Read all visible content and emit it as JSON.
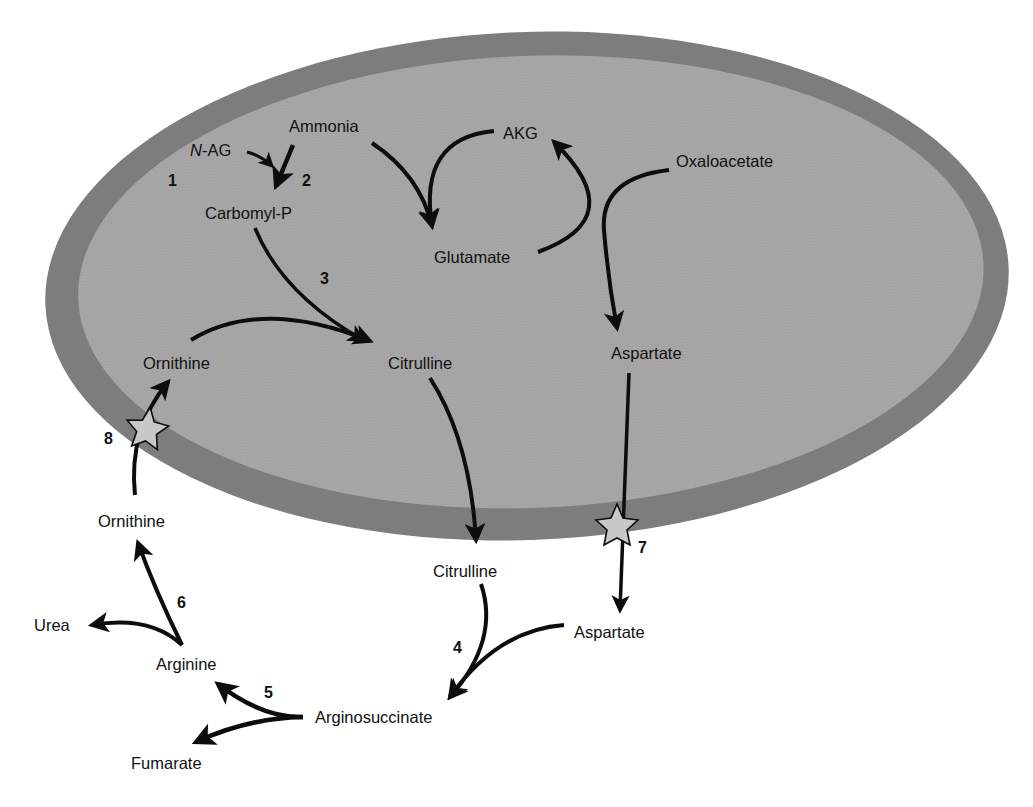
{
  "diagram": {
    "colors": {
      "membrane": "#7d7d7d",
      "matrix": "#a6a6a6",
      "arrow": "#0d0d0d",
      "transporter_star": "#c8c8c8",
      "background": "#ffffff"
    },
    "mitochondrion": {
      "metabolites": {
        "nag_prefix": "N",
        "nag_suffix": "-AG",
        "ammonia": "Ammonia",
        "carbomyl_p": "Carbomyl-P",
        "akg": "AKG",
        "oxaloacetate": "Oxaloacetate",
        "glutamate": "Glutamate",
        "ornithine": "Ornithine",
        "citrulline": "Citrulline",
        "aspartate": "Aspartate"
      }
    },
    "cytosol": {
      "metabolites": {
        "ornithine": "Ornithine",
        "citrulline": "Citrulline",
        "aspartate": "Aspartate",
        "urea": "Urea",
        "arginine": "Arginine",
        "arginosuccinate": "Arginosuccinate",
        "fumarate": "Fumarate"
      }
    },
    "steps": {
      "s1": "1",
      "s2": "2",
      "s3": "3",
      "s4": "4",
      "s5": "5",
      "s6": "6",
      "s7": "7",
      "s8": "8"
    },
    "transporters": [
      {
        "id": "ornithine-transporter",
        "step": "8"
      },
      {
        "id": "aspartate-transporter",
        "step": "7"
      }
    ]
  }
}
